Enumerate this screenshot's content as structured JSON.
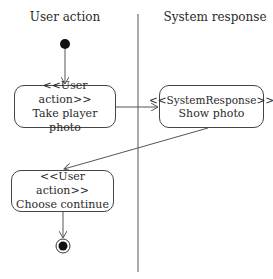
{
  "diagram": {
    "type": "UML activity diagram",
    "lanes": [
      {
        "id": "user",
        "title": "User action"
      },
      {
        "id": "system",
        "title": "System response"
      }
    ],
    "nodes": [
      {
        "id": "start",
        "kind": "initial",
        "lane": "user"
      },
      {
        "id": "take-photo",
        "kind": "action",
        "lane": "user",
        "stereotype": "<<User action>>",
        "label": "Take player photo"
      },
      {
        "id": "show-photo",
        "kind": "action",
        "lane": "system",
        "stereotype": "<<SystemResponse>>",
        "label": "Show photo"
      },
      {
        "id": "choose-continue",
        "kind": "action",
        "lane": "user",
        "stereotype": "<<User action>>",
        "label": "Choose continue"
      },
      {
        "id": "end",
        "kind": "final",
        "lane": "user"
      }
    ],
    "edges": [
      {
        "from": "start",
        "to": "take-photo"
      },
      {
        "from": "take-photo",
        "to": "show-photo"
      },
      {
        "from": "show-photo",
        "to": "choose-continue"
      },
      {
        "from": "choose-continue",
        "to": "end"
      }
    ]
  }
}
